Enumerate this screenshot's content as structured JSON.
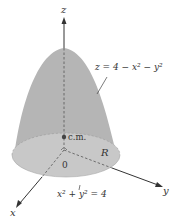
{
  "figure": {
    "surface_equation": "z = 4 − x² − y²",
    "base_equation": "x² + y² = 4",
    "axes": {
      "x": "x",
      "y": "y",
      "z": "z"
    },
    "origin_label": "0",
    "region_label": "R",
    "center_of_mass_label": "c.m.",
    "colors": {
      "surface": "#b4b4b4",
      "base_disk": "#c6c6c6",
      "axis": "#333333",
      "background": "#ffffff"
    }
  }
}
